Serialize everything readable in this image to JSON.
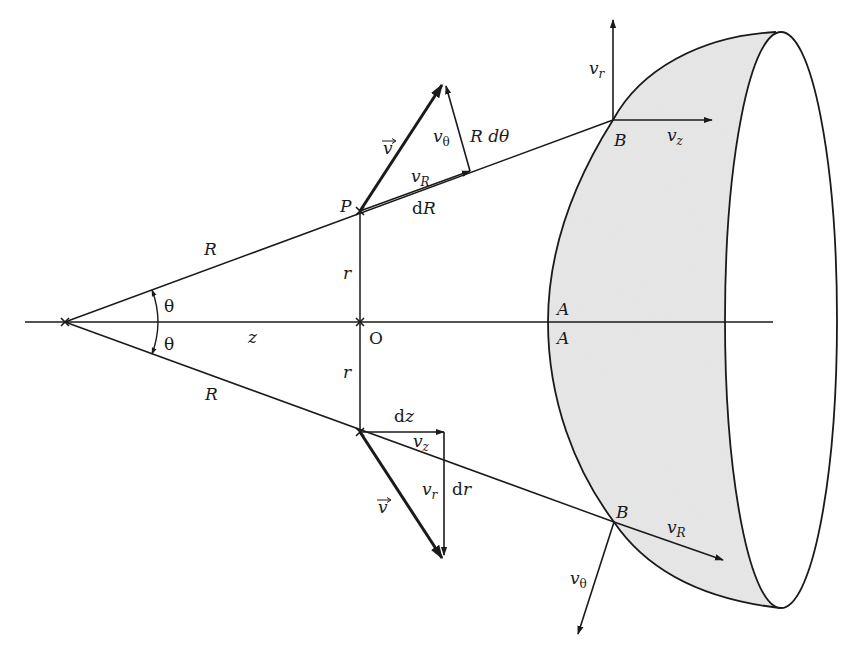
{
  "figure": {
    "colors": {
      "line": "#1a1a1a",
      "cap_fill": "#dcdcdc",
      "background": "#ffffff"
    }
  },
  "labels": {
    "R_upper": "R",
    "R_lower": "R",
    "theta_upper": "θ",
    "theta_lower": "θ",
    "z": "z",
    "O": "O",
    "r_upper": "r",
    "r_lower": "r",
    "P": "P",
    "v_vec_upper": "v",
    "v_vec_lower": "v",
    "vR_upper": "v",
    "vR_upper_sub": "R",
    "vtheta_upper": "v",
    "vtheta_upper_sub": "θ",
    "RdTheta": "R dθ",
    "dR": "dR",
    "B_upper": "B",
    "B_lower": "B",
    "vr_top": "v",
    "vr_top_sub": "r",
    "vz_top": "v",
    "vz_top_sub": "z",
    "A_upper": "A",
    "A_lower": "A",
    "dz": "dz",
    "vz_lower": "v",
    "vz_lower_sub": "z",
    "vr_lower": "v",
    "vr_lower_sub": "r",
    "dr": "dr",
    "vR_lower": "v",
    "vR_lower_sub": "R",
    "vtheta_lower": "v",
    "vtheta_lower_sub": "θ"
  }
}
